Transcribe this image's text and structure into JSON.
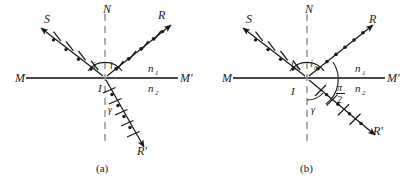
{
  "figure": {
    "background": "#ffffff",
    "ink": "#1a1a1a",
    "dash_color": "#9a9a9a",
    "panels": [
      {
        "id": "a",
        "caption": "(a)",
        "labels": {
          "normal": "N",
          "incident_ray": "S",
          "reflected_ray": "R",
          "refracted_ray": "R'",
          "interface_left": "M",
          "interface_right": "M'",
          "point_of_incidence": "I",
          "medium_upper": "n",
          "medium_upper_sub": "1",
          "medium_lower": "n",
          "medium_lower_sub": "2",
          "angle_incidence": "i",
          "angle_reflection": "i",
          "angle_refraction": "γ"
        },
        "ray_markers": {
          "incident": "ticks-and-dots",
          "reflected": "ticks-and-dots",
          "refracted": "ticks-and-dots"
        }
      },
      {
        "id": "b",
        "caption": "(b)",
        "labels": {
          "normal": "N",
          "incident_ray": "S",
          "reflected_ray": "R",
          "refracted_ray": "R'",
          "interface_left": "M",
          "interface_right": "M'",
          "point_of_incidence": "I",
          "medium_upper": "n",
          "medium_upper_sub": "1",
          "medium_lower": "n",
          "medium_lower_sub": "2",
          "angle_incidence": "i",
          "angle_incidence_sub": "0",
          "angle_reflection": "i",
          "angle_reflection_sub": "0",
          "angle_refraction": "γ",
          "right_angle_num": "π",
          "right_angle_den": "2"
        },
        "ray_markers": {
          "incident": "ticks-and-dots",
          "reflected": "dots-only",
          "refracted": "ticks-and-dots"
        }
      }
    ]
  }
}
